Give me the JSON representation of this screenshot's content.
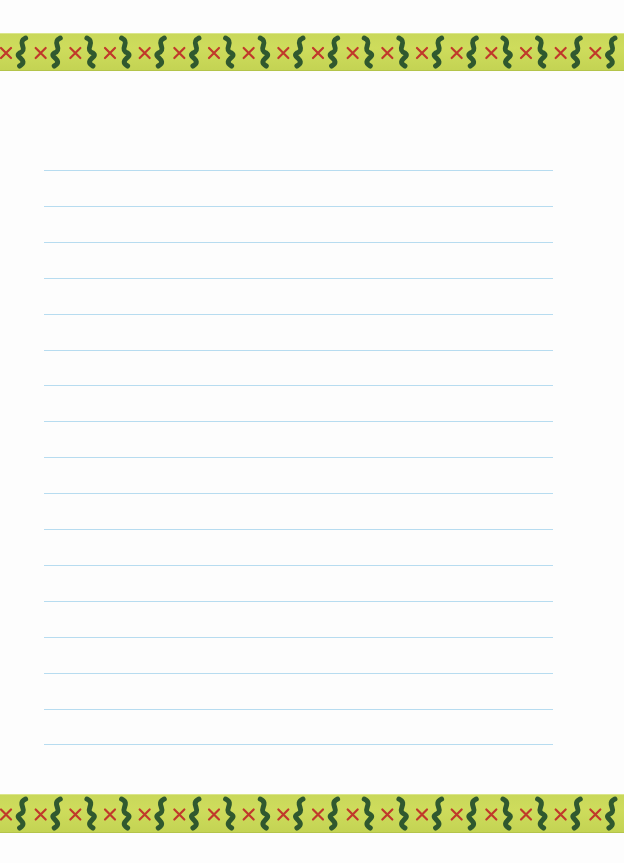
{
  "page": {
    "type": "lined-stationery",
    "background": "#fdfdfd"
  },
  "border": {
    "band_color": "#cbd95a",
    "cross_color": "#c0392b",
    "squiggle_color": "#1f4a2a",
    "top_pattern": [
      "x",
      "S",
      "x",
      "S",
      "x",
      "S",
      "x",
      "S",
      "x",
      "S",
      "x",
      "S",
      "x",
      "S",
      "x",
      "S",
      "x",
      "S",
      "x",
      "S",
      "x",
      "S",
      "x",
      "S",
      "x",
      "S",
      "x",
      "S",
      "x",
      "S",
      "x",
      "S",
      "x",
      "S",
      "x",
      "S"
    ],
    "bottom_pattern": [
      "x",
      "S",
      "x",
      "S",
      "x",
      "S",
      "x",
      "S",
      "x",
      "S",
      "x",
      "S",
      "x",
      "S",
      "x",
      "S",
      "x",
      "S",
      "x",
      "S",
      "x",
      "S",
      "x",
      "S",
      "x",
      "S",
      "x",
      "S",
      "x",
      "S",
      "x",
      "S",
      "x",
      "S",
      "x",
      "S"
    ]
  },
  "rules": {
    "color": "#b7dcf0",
    "left": 44,
    "width": 509,
    "first_y": 170,
    "spacing": 35.9,
    "count": 17
  }
}
